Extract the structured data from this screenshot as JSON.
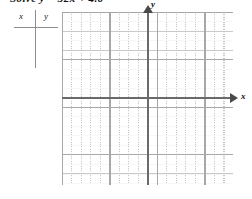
{
  "problem": {
    "text": "Solve y = 32x + 4.6"
  },
  "value_table": {
    "name": "xy-value-table",
    "headers": {
      "x": "x",
      "y": "y"
    },
    "rows": []
  },
  "coordinate_plane": {
    "x_axis_label": "x",
    "y_axis_label": "y",
    "grid": {
      "minor_spacing_px": 9.5,
      "major_every": 5,
      "minor_color": "#c9c9c9",
      "major_color": "#a8a8a8",
      "axis_color": "#6a6a6a"
    }
  },
  "chart_data": {
    "type": "scatter",
    "title": "",
    "xlabel": "x",
    "ylabel": "y",
    "series": [],
    "x": [],
    "values": [],
    "xlim": [
      -9,
      9
    ],
    "ylim": [
      -9,
      9
    ],
    "grid": true,
    "legend": "none"
  }
}
